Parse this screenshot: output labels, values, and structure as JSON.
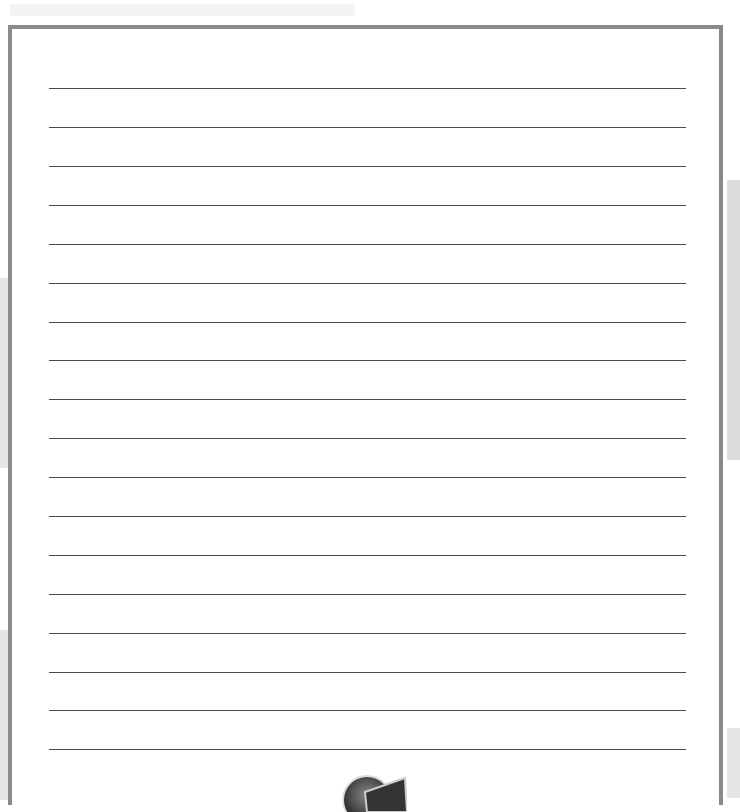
{
  "page": {
    "type": "lined-paper",
    "frame_color": "#8a8a8a",
    "line_color": "#4a4a4a",
    "line_count": 18,
    "line_y_positions": [
      88,
      127,
      166,
      205,
      244,
      283,
      322,
      360,
      399,
      438,
      477,
      516,
      555,
      594,
      633,
      672,
      710,
      749
    ]
  }
}
